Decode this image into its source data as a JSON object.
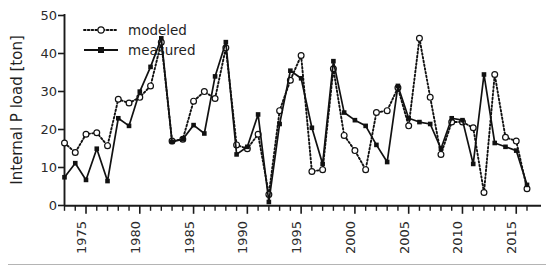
{
  "chart_data": {
    "type": "line",
    "title": "",
    "subtitle": "",
    "xlabel": "",
    "ylabel": "Internal P load [ton]",
    "ylim": [
      0,
      50
    ],
    "xlim": [
      1973,
      2016
    ],
    "grid": false,
    "legend_position": "top-left",
    "y_ticks": [
      "0",
      "10",
      "20",
      "30",
      "40",
      "50"
    ],
    "y_tick_values": [
      0,
      10,
      20,
      30,
      40,
      50
    ],
    "x_ticks": [
      "1975",
      "1980",
      "1985",
      "1990",
      "1995",
      "2000",
      "2005",
      "2010",
      "2015"
    ],
    "x_tick_values": [
      1975,
      1980,
      1985,
      1990,
      1995,
      2000,
      2005,
      2010,
      2015
    ],
    "x": [
      1973,
      1974,
      1975,
      1976,
      1977,
      1978,
      1979,
      1980,
      1981,
      1982,
      1983,
      1984,
      1985,
      1986,
      1987,
      1988,
      1989,
      1990,
      1991,
      1992,
      1993,
      1994,
      1995,
      1996,
      1997,
      1998,
      1999,
      2000,
      2001,
      2002,
      2003,
      2004,
      2005,
      2006,
      2007,
      2008,
      2009,
      2010,
      2011,
      2012,
      2013,
      2014,
      2015,
      2016
    ],
    "series": [
      {
        "name": "modeled",
        "marker": "open-circle",
        "linestyle": "dotted",
        "color": "#111111",
        "values": [
          16.5,
          14.0,
          18.8,
          19.2,
          15.8,
          28.0,
          27.0,
          28.5,
          31.5,
          43.0,
          17.0,
          17.5,
          27.5,
          30.0,
          28.2,
          41.5,
          16.0,
          15.0,
          18.8,
          3.0,
          25.0,
          33.0,
          39.5,
          9.0,
          9.5,
          36.0,
          18.5,
          14.5,
          9.5,
          24.5,
          25.0,
          31.0,
          21.0,
          44.0,
          28.5,
          13.5,
          22.0,
          22.0,
          20.5,
          3.5,
          34.5,
          18.0,
          17.0,
          4.5
        ]
      },
      {
        "name": "measured",
        "marker": "filled-square",
        "linestyle": "solid",
        "color": "#111111",
        "values": [
          7.5,
          11.2,
          6.8,
          15.0,
          6.5,
          23.0,
          21.0,
          30.0,
          36.5,
          44.0,
          16.8,
          17.5,
          21.2,
          19.0,
          34.0,
          43.0,
          13.5,
          15.5,
          24.0,
          1.0,
          21.5,
          35.5,
          33.5,
          20.5,
          11.0,
          38.0,
          24.5,
          22.5,
          21.0,
          16.0,
          11.5,
          31.5,
          23.0,
          22.0,
          21.5,
          15.0,
          23.0,
          22.5,
          11.0,
          34.5,
          16.5,
          15.5,
          14.5,
          5.5
        ]
      }
    ]
  },
  "legend": {
    "items": [
      {
        "label": "modeled"
      },
      {
        "label": "measured"
      }
    ]
  },
  "axis": {
    "y_title": "Internal P load [ton]"
  }
}
